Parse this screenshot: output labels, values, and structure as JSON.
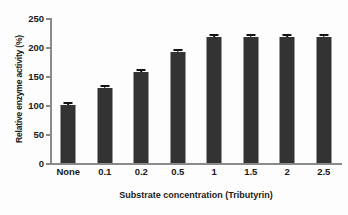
{
  "chart_data": {
    "type": "bar",
    "title": "",
    "xlabel": "Substrate concentration  (Tributyrin)",
    "ylabel": "Relative enzyme activity (%)",
    "categories": [
      "None",
      "0.1",
      "0.2",
      "0.5",
      "1",
      "1.5",
      "2",
      "2.5"
    ],
    "values": [
      100,
      129,
      157,
      191,
      217,
      217,
      217,
      217
    ],
    "errors": [
      2,
      2,
      2,
      2,
      2,
      2,
      2,
      2
    ],
    "ylim": [
      0,
      250
    ],
    "yticks": [
      0,
      50,
      100,
      150,
      200,
      250
    ],
    "ytick_labels": [
      "0",
      "50",
      "100",
      "150",
      "200",
      "250"
    ],
    "grid": false,
    "legend": false,
    "bar_color": "#333333",
    "axis_color": "#8a8a8a",
    "text_color": "#1a1a1a",
    "background_color": "#fdfdfd"
  }
}
